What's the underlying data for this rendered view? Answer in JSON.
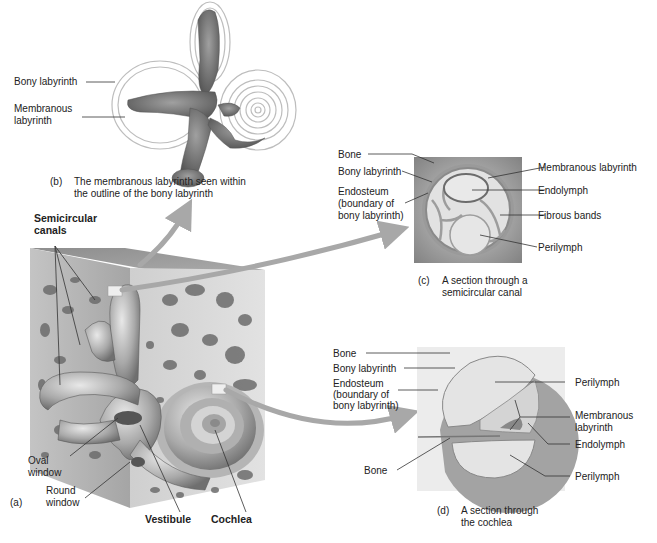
{
  "figure": {
    "panels": {
      "a": {
        "tag": "(a)",
        "labels": {
          "semicircular_canals": "Semicircular canals",
          "semicircular_line1": "Semicircular",
          "semicircular_line2": "canals",
          "oval_window_1": "Oval",
          "oval_window_2": "window",
          "round_window_1": "Round",
          "round_window_2": "window",
          "vestibule": "Vestibule",
          "cochlea": "Cochlea"
        }
      },
      "b": {
        "tag": "(b)",
        "caption_line1": "The membranous labyrinth seen within",
        "caption_line2": "the outline of the bony labyrinth",
        "labels": {
          "bony_labyrinth": "Bony labyrinth",
          "membranous_1": "Membranous",
          "membranous_2": "labyrinth"
        }
      },
      "c": {
        "tag": "(c)",
        "caption_line1": "A section through a",
        "caption_line2": "semicircular canal",
        "labels": {
          "bone": "Bone",
          "bony_labyrinth": "Bony labyrinth",
          "endosteum_1": "Endosteum",
          "endosteum_2": "(boundary of",
          "endosteum_3": "bony labyrinth)",
          "membranous_labyrinth": "Membranous labyrinth",
          "endolymph": "Endolymph",
          "fibrous_bands": "Fibrous bands",
          "perilymph": "Perilymph"
        }
      },
      "d": {
        "tag": "(d)",
        "caption_line1": "A section through",
        "caption_line2": "the cochlea",
        "labels": {
          "bone_top": "Bone",
          "bony_labyrinth": "Bony labyrinth",
          "endosteum_1": "Endosteum",
          "endosteum_2": "(boundary of",
          "endosteum_3": "bony labyrinth)",
          "bone_bottom": "Bone",
          "perilymph_top": "Perilymph",
          "membranous_1": "Membranous",
          "membranous_2": "labyrinth",
          "endolymph": "Endolymph",
          "perilymph_bottom": "Perilymph"
        }
      }
    },
    "colors": {
      "background": "#ffffff",
      "bone_dark": "#8f8f8f",
      "bone_light": "#d9d9d9",
      "labyrinth": "#9a9a9a",
      "fluid": "#e6e6e6",
      "arrow": "#a8a8a8",
      "leader": "#333333"
    }
  }
}
